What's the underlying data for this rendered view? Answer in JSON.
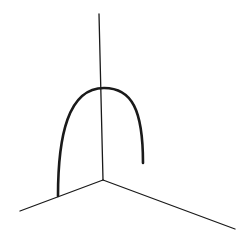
{
  "diagram": {
    "type": "3d-axes-with-curve",
    "background": "#ffffff",
    "stroke_color": "#1a1a1a",
    "origin": [
      103,
      180
    ],
    "axes": [
      {
        "name": "vertical-axis",
        "from": [
          103,
          180
        ],
        "to": [
          99,
          14
        ],
        "width": 1.3
      },
      {
        "name": "left-axis",
        "from": [
          103,
          180
        ],
        "to": [
          20,
          211
        ],
        "width": 1.3
      },
      {
        "name": "right-axis",
        "from": [
          103,
          180
        ],
        "to": [
          235,
          229
        ],
        "width": 1.3
      }
    ],
    "curve": {
      "name": "arc-curve",
      "start": [
        58,
        196
      ],
      "apex": [
        104,
        88
      ],
      "end": [
        143,
        163
      ],
      "width": 2.6
    }
  }
}
